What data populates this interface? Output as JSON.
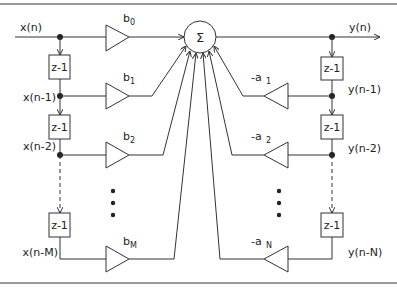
{
  "diagram": {
    "summer": {
      "symbol": "Σ"
    },
    "input": {
      "label": "x(n)"
    },
    "output": {
      "label": "y(n)"
    },
    "delay_label": "z-1",
    "feedforward": {
      "taps": [
        {
          "signal": "x(n)",
          "gain": "b",
          "gain_sub": "0"
        },
        {
          "signal": "x(n-1)",
          "gain": "b",
          "gain_sub": "1"
        },
        {
          "signal": "x(n-2)",
          "gain": "b",
          "gain_sub": "2"
        },
        {
          "signal": "x(n-M)",
          "gain": "b",
          "gain_sub": "M"
        }
      ]
    },
    "feedback": {
      "taps": [
        {
          "signal": "y(n-1)",
          "gain": "-a",
          "gain_sub": "1"
        },
        {
          "signal": "y(n-2)",
          "gain": "-a",
          "gain_sub": "2"
        },
        {
          "signal": "y(n-N)",
          "gain": "-a",
          "gain_sub": "N"
        }
      ]
    },
    "ellipsis": "⋮"
  }
}
